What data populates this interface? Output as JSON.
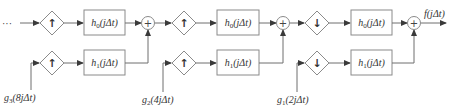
{
  "diagram": {
    "input_ellipsis": "···",
    "output_label": "f(jΔt)",
    "stages": [
      {
        "id": "stage-1",
        "sampler_top": "↑",
        "sampler_bottom": "↑",
        "filter_top": "h0(jΔt)",
        "filter_bottom": "h1(jΔt)",
        "input_label": "g3(8jΔt)",
        "sum": "+"
      },
      {
        "id": "stage-2",
        "sampler_top": "↑",
        "sampler_bottom": "↑",
        "filter_top": "h0(jΔt)",
        "filter_bottom": "h1(jΔt)",
        "input_label": "g2(4jΔt)",
        "sum": "+"
      },
      {
        "id": "stage-3",
        "sampler_top": "↓",
        "sampler_bottom": "↓",
        "filter_top": "h0(jΔt)",
        "filter_bottom": "h1(jΔt)",
        "input_label": "g1(2jΔt)",
        "sum": "+"
      }
    ]
  }
}
